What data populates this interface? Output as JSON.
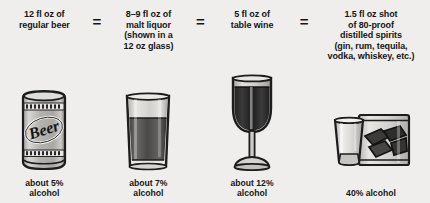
{
  "infographic": {
    "title_hidden": "Standard drink equivalents",
    "equals_symbol": "=",
    "items": [
      {
        "id": "regular-beer",
        "top_lines": [
          "12 fl oz of",
          "regular beer"
        ],
        "bottom_lines": [
          "about 5%",
          "alcohol"
        ],
        "abv": "5%",
        "volume": "12 fl oz",
        "vessel": "beer-can",
        "vessel_label": "Beer"
      },
      {
        "id": "malt-liquor",
        "top_lines": [
          "8–9 fl oz of",
          "malt liquor",
          "(shown in a",
          "12 oz glass)"
        ],
        "bottom_lines": [
          "about 7%",
          "alcohol"
        ],
        "abv": "7%",
        "volume": "8–9 fl oz",
        "vessel": "pint-glass"
      },
      {
        "id": "table-wine",
        "top_lines": [
          "5 fl oz of",
          "table wine"
        ],
        "bottom_lines": [
          "about 12%",
          "alcohol"
        ],
        "abv": "12%",
        "volume": "5 fl oz",
        "vessel": "wine-glass"
      },
      {
        "id": "distilled-spirits",
        "top_lines": [
          "1.5 fl oz shot",
          "of 80-proof",
          "distilled spirits",
          "(gin, rum, tequila,",
          "vodka, whiskey, etc.)"
        ],
        "bottom_lines": [
          "40% alcohol"
        ],
        "abv": "40%",
        "volume": "1.5 fl oz",
        "vessel": "shot-glass-and-tumbler"
      }
    ],
    "colors": {
      "background": "#efeeec",
      "ink": "#1b1b1b",
      "glass_light": "#c9c8c6",
      "liquid_dark": "#2f2f2f",
      "foam": "#dcdbd9"
    }
  }
}
